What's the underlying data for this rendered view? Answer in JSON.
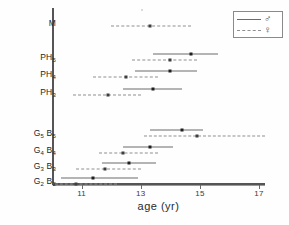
{
  "chart_data": {
    "type": "scatter",
    "title": "",
    "xlabel": "age (yr)",
    "ylabel": "",
    "xlim": [
      10.0,
      17.2
    ],
    "xticks": [
      11,
      13,
      15,
      17
    ],
    "xtick_labels": [
      "11",
      "13",
      "15",
      "17"
    ],
    "grid": false,
    "legend_position": "top-right",
    "legend": [
      {
        "name": "male",
        "symbol": "♂",
        "style": "solid"
      },
      {
        "name": "female",
        "symbol": "♀",
        "style": "dashed"
      }
    ],
    "categories": [
      "M",
      "PH5",
      "PH4",
      "PH3",
      "G5B5",
      "G4B4",
      "G3B3",
      "G2B2"
    ],
    "category_labels": [
      {
        "base": "M",
        "sub": ""
      },
      {
        "base": "PH",
        "sub": "5"
      },
      {
        "base": "PH",
        "sub": "4"
      },
      {
        "base": "PH",
        "sub": "3"
      },
      {
        "base": "G",
        "sub": "5",
        "base2": "B",
        "sub2": "5"
      },
      {
        "base": "G",
        "sub": "4",
        "base2": "B",
        "sub2": "4"
      },
      {
        "base": "G",
        "sub": "3",
        "base2": "B",
        "sub2": "3"
      },
      {
        "base": "G",
        "sub": "2",
        "base2": "B",
        "sub2": "2"
      }
    ],
    "series": [
      {
        "name": "male",
        "style": "solid",
        "points": [
          {
            "category": "PH5",
            "mean": 14.7,
            "low": 13.4,
            "high": 15.6
          },
          {
            "category": "PH4",
            "mean": 14.0,
            "low": 12.8,
            "high": 14.9
          },
          {
            "category": "PH3",
            "mean": 13.4,
            "low": 12.4,
            "high": 14.4
          },
          {
            "category": "G5B5",
            "mean": 14.4,
            "low": 13.3,
            "high": 15.1
          },
          {
            "category": "G4B4",
            "mean": 13.3,
            "low": 12.4,
            "high": 14.1
          },
          {
            "category": "G3B3",
            "mean": 12.6,
            "low": 11.7,
            "high": 13.5
          },
          {
            "category": "G2B2",
            "mean": 11.4,
            "low": 10.3,
            "high": 12.9
          }
        ]
      },
      {
        "name": "female",
        "style": "dashed",
        "points": [
          {
            "category": "M",
            "mean": 13.3,
            "low": 12.0,
            "high": 14.7
          },
          {
            "category": "PH5",
            "mean": 14.0,
            "low": 12.7,
            "high": 14.9
          },
          {
            "category": "PH4",
            "mean": 12.5,
            "low": 11.4,
            "high": 13.6
          },
          {
            "category": "PH3",
            "mean": 11.9,
            "low": 10.7,
            "high": 13.0
          },
          {
            "category": "G5B5",
            "mean": 14.9,
            "low": 13.1,
            "high": 17.2
          },
          {
            "category": "G4B4",
            "mean": 12.4,
            "low": 11.6,
            "high": 13.6
          },
          {
            "category": "G3B3",
            "mean": 11.8,
            "low": 10.8,
            "high": 13.0
          },
          {
            "category": "G2B2",
            "mean": 10.8,
            "low": 10.1,
            "high": 12.2
          }
        ]
      }
    ]
  }
}
